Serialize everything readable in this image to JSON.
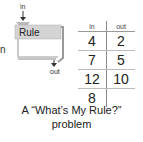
{
  "left_fragment": "n",
  "machine": {
    "input_label": "in",
    "rule_label": "Rule",
    "output_label": "out"
  },
  "table": {
    "headers": [
      "in",
      "out"
    ],
    "rows": [
      [
        "4",
        "2"
      ],
      [
        "7",
        "5"
      ],
      [
        "12",
        "10"
      ],
      [
        "8",
        ""
      ]
    ]
  },
  "caption": {
    "line1": "A “What’s My Rule?”",
    "line2": "problem"
  }
}
